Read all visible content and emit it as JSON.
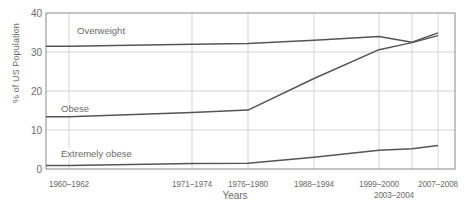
{
  "chart_data": {
    "type": "line",
    "title": "",
    "xlabel": "Years",
    "ylabel": "% of US Population",
    "categories": [
      "1960–1962",
      "1971–1974",
      "1976–1980",
      "1988–1994",
      "1999–2000",
      "2003–2004",
      "2007–2008"
    ],
    "ylim": [
      0,
      40
    ],
    "yticks": [
      0,
      10,
      20,
      30,
      40
    ],
    "grid": true,
    "legend_position": "inline-labels",
    "series": [
      {
        "name": "Overweight",
        "color": "#555555",
        "values": [
          31.5,
          32.0,
          32.2,
          33.0,
          34.0,
          32.5,
          34.9
        ]
      },
      {
        "name": "Obese",
        "color": "#555555",
        "values": [
          13.4,
          14.5,
          15.1,
          23.2,
          30.6,
          32.4,
          34.2
        ]
      },
      {
        "name": "Extremely obese",
        "color": "#555555",
        "values": [
          0.9,
          1.4,
          1.5,
          3.0,
          4.8,
          5.2,
          6.0
        ]
      }
    ]
  },
  "axis": {
    "y_ticks": [
      "0",
      "10",
      "20",
      "30",
      "40"
    ],
    "x_ticks": [
      "1960–1962",
      "1971–1974",
      "1976–1980",
      "1988–1994",
      "1999–2000",
      "2003–2004",
      "2007–2008"
    ],
    "x_title": "Years",
    "y_title": "% of US Population"
  },
  "series_labels": {
    "overweight": "Overweight",
    "obese": "Obese",
    "extremely_obese": "Extremely obese"
  },
  "colors": {
    "line": "#555555",
    "grid": "#c9c9c9",
    "axis": "#8a8a8a",
    "text": "#6b6b6b"
  }
}
